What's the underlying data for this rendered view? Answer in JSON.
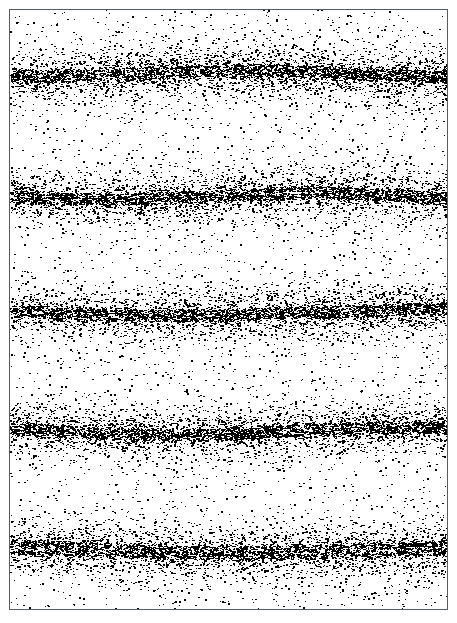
{
  "figure": {
    "caption": "",
    "background_color": "#ffffff",
    "frame_color": "#555d63",
    "dot_color": "#000000",
    "width_px": 457,
    "height_px": 623
  },
  "chart_data": {
    "type": "scatter",
    "title": "",
    "subtitle": "",
    "xlabel": "",
    "ylabel": "",
    "xlim": [
      0,
      437
    ],
    "ylim": [
      0,
      599
    ],
    "grid": false,
    "legend_position": "none",
    "axis_ticks_visible": false,
    "tick_labels_x": [],
    "tick_labels_y": [],
    "annotations": [],
    "total_points": 26000,
    "point_size_px": [
      1,
      3
    ],
    "background_noise_points": 2100,
    "series": [
      {
        "name": "band-1",
        "center_y": 63,
        "core_half_width": 6,
        "halo_sigma": 22,
        "points": 4900,
        "peak_density": 1.0
      },
      {
        "name": "band-2",
        "center_y": 186,
        "core_half_width": 6,
        "halo_sigma": 21,
        "points": 4800,
        "peak_density": 0.98
      },
      {
        "name": "band-3",
        "center_y": 302,
        "core_half_width": 6,
        "halo_sigma": 23,
        "points": 4700,
        "peak_density": 0.93
      },
      {
        "name": "band-4",
        "center_y": 421,
        "core_half_width": 6,
        "halo_sigma": 22,
        "points": 4800,
        "peak_density": 0.96
      },
      {
        "name": "band-5",
        "center_y": 540,
        "core_half_width": 7,
        "halo_sigma": 24,
        "points": 4700,
        "peak_density": 0.95
      }
    ],
    "band_centers_y": [
      63,
      186,
      302,
      421,
      540
    ],
    "band_spacing_y": [
      123,
      116,
      119,
      119
    ],
    "gap_centers_y": [
      125,
      244,
      362,
      481
    ]
  }
}
